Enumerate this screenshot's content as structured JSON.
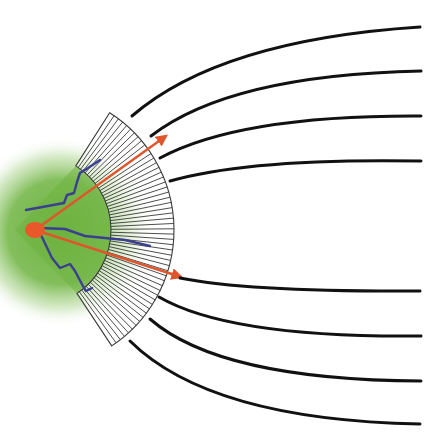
{
  "diagram": {
    "type": "collimator-field-diagram",
    "width": 444,
    "height": 436,
    "colors": {
      "background": "#ffffff",
      "glow": "#6db33f",
      "source": "#e8582a",
      "ray": "#e0562c",
      "track": "#3b3f8f",
      "slat": "#3a3a3a",
      "field_line": "#111111"
    },
    "source": {
      "cx": 35,
      "cy": 230,
      "rx": 10,
      "ry": 8
    },
    "glow": {
      "cx": 60,
      "cy": 232,
      "r": 95
    },
    "collimator": {
      "cx": 35,
      "cy": 230,
      "inner_radius": 76,
      "outer_radius": 139,
      "start_angle_deg": -57.5,
      "end_angle_deg": 56.5,
      "slat_count": 52
    },
    "rays": [
      {
        "name": "upper-ray",
        "x1": 35,
        "y1": 230,
        "x2": 166,
        "y2": 136
      },
      {
        "name": "lower-ray",
        "x1": 35,
        "y1": 230,
        "x2": 181,
        "y2": 277
      }
    ],
    "tracks": [
      {
        "name": "upper-track",
        "points": "26,210 64,203 67,195 74,193 77,182 80,173 88,168 100,160"
      },
      {
        "name": "middle-track",
        "points": "40,228 65,229 85,236 105,238 125,240 150,246"
      },
      {
        "name": "lower-track",
        "points": "40,233 52,258 60,268 70,264 75,271 84,288 86,291 92,288"
      }
    ],
    "field_lines": [
      {
        "name": "field-line-1",
        "d": "M132,116 Q220,40 420,27"
      },
      {
        "name": "field-line-2",
        "d": "M151,136 Q230,75 421,71"
      },
      {
        "name": "field-line-3",
        "d": "M160,158 Q240,115 421,116"
      },
      {
        "name": "field-line-4",
        "d": "M170,181 Q250,158 421,161"
      },
      {
        "name": "field-line-5",
        "d": "M180,278 Q250,292 420,291"
      },
      {
        "name": "field-line-6",
        "d": "M159,297 Q230,338 421,336"
      },
      {
        "name": "field-line-7",
        "d": "M150,319 Q220,380 421,381"
      },
      {
        "name": "field-line-8",
        "d": "M130,341 Q210,420 420,424"
      }
    ]
  }
}
